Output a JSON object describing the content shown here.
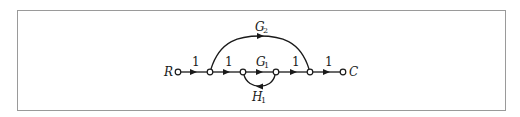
{
  "diagram": {
    "type": "signal-flow-graph",
    "input_label": "R",
    "output_label": "C",
    "nodes": [
      {
        "id": "R",
        "x": 178,
        "y": 72
      },
      {
        "id": "n1",
        "x": 210,
        "y": 72
      },
      {
        "id": "n2",
        "x": 243,
        "y": 72
      },
      {
        "id": "n3",
        "x": 276,
        "y": 72
      },
      {
        "id": "n4",
        "x": 310,
        "y": 72
      },
      {
        "id": "C",
        "x": 343,
        "y": 72
      }
    ],
    "branches": [
      {
        "from": "R",
        "to": "n1",
        "gain": "1"
      },
      {
        "from": "n1",
        "to": "n2",
        "gain": "1"
      },
      {
        "from": "n2",
        "to": "n3",
        "gain_main": "G",
        "gain_sub": "1"
      },
      {
        "from": "n3",
        "to": "n4",
        "gain": "1"
      },
      {
        "from": "n4",
        "to": "C",
        "gain": "1"
      },
      {
        "from": "n1",
        "to": "n4",
        "gain_main": "G",
        "gain_sub": "2",
        "shape": "arc-top"
      },
      {
        "from": "n3",
        "to": "n2",
        "gain_main": "H",
        "gain_sub": "1",
        "shape": "loop-bottom"
      }
    ],
    "labels": {
      "R": "R",
      "C": "C",
      "g1_main": "G",
      "g1_sub": "1",
      "g2_main": "G",
      "g2_sub": "2",
      "h1_main": "H",
      "h1_sub": "1",
      "gain_r_n1": "1",
      "gain_n1_n2": "1",
      "gain_n3_n4": "1",
      "gain_n4_c": "1"
    }
  }
}
